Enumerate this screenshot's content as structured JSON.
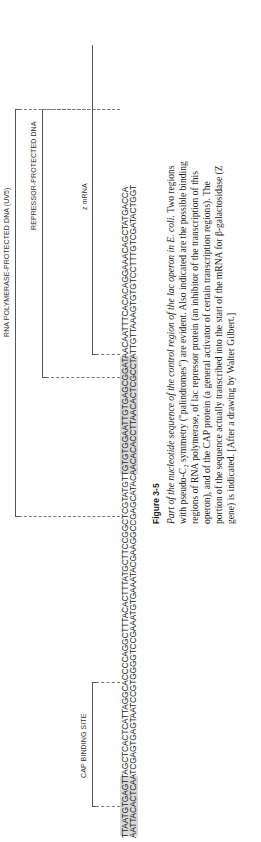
{
  "figure": {
    "number": "Figure 3-5",
    "caption_italic": "Part of the nucleotide sequence of the control region of the lac operon in E. coli.",
    "caption_body": " Two regions with pseudo-C₂ symmetry (\"palindromes\") are evident. Also indicated are the possible binding regions of RNA polymerase, of lac repressor protein (an inhibitor of the transcription of this operon), and of the CAP protein (a general activator of certain transcription regions). The portion of the sequence actually transcribed into the start of the mRNA for β-galactosidase (Z gene) is indicated. [After a drawing by Walter Gilbert.]"
  },
  "sequence": {
    "top_strand": "TTAATGTGAGTTAGCTCACTCATTAGGCACCCCAGGCTTTACACTTTATGCTTCCGGCTCGTATGTTGTGTGGAATTGTGAGCGGATAACAATTTCACACAGGAAACAGCTATGACCA",
    "bottom_strand": "AATTACACTCAATCGAGTGAGTAATCCGTGGGGTCCGAAATGTGAAATACGAAGGCCGAGCATACAACACACCTTAACACTCGCCTATTGTTAAAGTGTGTCCTTTGTCGATACTGGT"
  },
  "annotations": {
    "cap_binding_site": "CAP BINDING SITE",
    "rna_polymerase": "RNA POLYMERASE-PROTECTED DNA (UV5)",
    "repressor": "REPRESSOR-PROTECTED DNA",
    "z_mrna": "z mRNA"
  },
  "colors": {
    "shading": "#d9d9d9",
    "text": "#222222",
    "bracket": "#555555"
  }
}
